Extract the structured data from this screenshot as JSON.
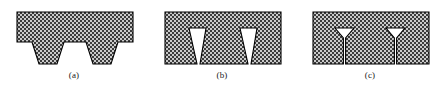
{
  "figure": {
    "width": 445,
    "height": 94,
    "background_color": "#ffffff",
    "outline_color": "#000000",
    "hatch_fill_color": "#c8c8c8",
    "hatch_dot_color": "#404040",
    "caption_color": "#1a1a1a"
  },
  "panels": [
    {
      "id": "a",
      "caption": "(a)",
      "label": "wide trapezoidal grooves",
      "feature_count": 2,
      "feature_shape": "trapezoid",
      "body": {
        "x": 17,
        "y": 12,
        "width": 116,
        "height": 30
      },
      "protrusions": [
        {
          "top_left": 32,
          "top_right": 64,
          "bottom_left": 39,
          "bottom_right": 57,
          "depth": 22
        },
        {
          "top_left": 86,
          "top_right": 118,
          "bottom_left": 93,
          "bottom_right": 111,
          "depth": 22
        }
      ]
    },
    {
      "id": "b",
      "caption": "(b)",
      "label": "narrow tapered notches",
      "feature_count": 2,
      "feature_shape": "inverted-taper-notch",
      "body": {
        "x": 17,
        "y": 12,
        "width": 116,
        "height": 52
      },
      "notches": [
        {
          "top_left": 41,
          "top_right": 58,
          "bottom_left": 49,
          "bottom_right": 52,
          "top": 28,
          "bottom": 64
        },
        {
          "top_left": 92,
          "top_right": 109,
          "bottom_left": 100,
          "bottom_right": 103,
          "top": 28,
          "bottom": 64
        }
      ]
    },
    {
      "id": "c",
      "caption": "(c)",
      "label": "funnel cracks",
      "feature_count": 2,
      "feature_shape": "funnel-crack",
      "body": {
        "x": 17,
        "y": 12,
        "width": 116,
        "height": 52
      },
      "cracks": [
        {
          "mouth_left": 39,
          "mouth_right": 58,
          "stem_x": 48.5,
          "top": 28,
          "throat": 38,
          "bottom": 64
        },
        {
          "mouth_left": 90,
          "mouth_right": 109,
          "stem_x": 99.5,
          "top": 28,
          "throat": 38,
          "bottom": 64
        }
      ]
    }
  ]
}
